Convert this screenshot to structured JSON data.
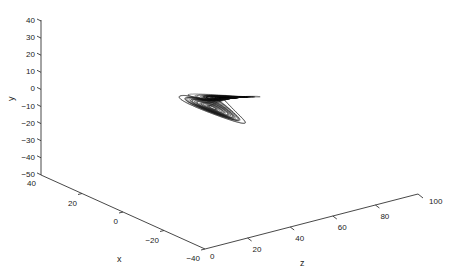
{
  "chart_data": {
    "type": "line3d",
    "title": "",
    "axes": {
      "x": {
        "label": "x",
        "ticks": [
          40,
          20,
          0,
          -20,
          -40
        ],
        "range": [
          -40,
          40
        ]
      },
      "y": {
        "label": "y",
        "ticks": [
          40,
          30,
          20,
          10,
          0,
          -10,
          -20,
          -30,
          -40,
          -50
        ],
        "range": [
          -50,
          40
        ]
      },
      "z": {
        "label": "z",
        "ticks": [
          0,
          20,
          40,
          60,
          80,
          100
        ],
        "range": [
          0,
          100
        ]
      }
    },
    "grid": false,
    "legend": null,
    "series": [
      {
        "name": "trajectory",
        "color": "#111111",
        "system": "lorenz",
        "sigma": 10,
        "rho": 28,
        "beta": 2.6667
      }
    ]
  },
  "labels": {
    "x": "x",
    "y": "y",
    "z": "z",
    "y_ticks": [
      "40",
      "30",
      "20",
      "10",
      "0",
      "−10",
      "−20",
      "−30",
      "−40",
      "−50"
    ],
    "x_ticks": [
      "40",
      "20",
      "0",
      "−20",
      "−40"
    ],
    "z_ticks": [
      "0",
      "20",
      "40",
      "60",
      "80",
      "100"
    ]
  }
}
